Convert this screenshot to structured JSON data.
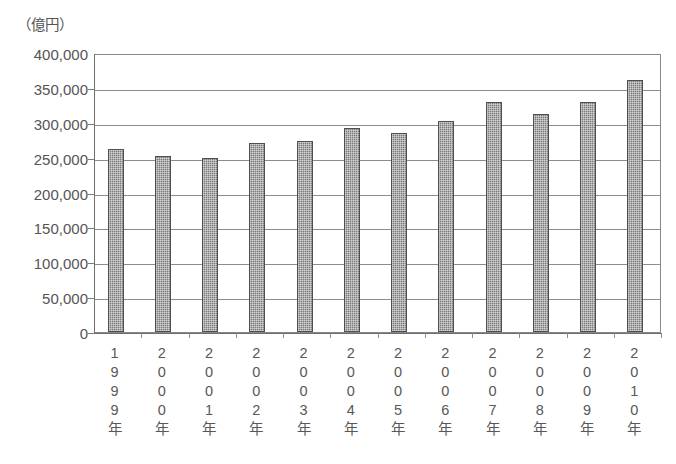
{
  "chart_data": {
    "type": "bar",
    "title": "（億円）",
    "unit_label": "（億円）",
    "xlabel": "",
    "ylabel": "",
    "ylim": [
      0,
      400000
    ],
    "ytick_step": 50000,
    "grid": true,
    "legend": "none",
    "bar_color": "#7b7b7b",
    "bar_border_color": "#4f4f4f",
    "categories": [
      "1999年",
      "2000年",
      "2001年",
      "2002年",
      "2003年",
      "2004年",
      "2005年",
      "2006年",
      "2007年",
      "2008年",
      "2009年",
      "2010年"
    ],
    "values": [
      263000,
      252000,
      250000,
      271000,
      274000,
      293000,
      285000,
      302000,
      330000,
      313000,
      330000,
      361000
    ],
    "ytick_labels": [
      "400,000",
      "350,000",
      "300,000",
      "250,000",
      "200,000",
      "150,000",
      "100,000",
      "50,000",
      "0"
    ],
    "ytick_values": [
      400000,
      350000,
      300000,
      250000,
      200000,
      150000,
      100000,
      50000,
      0
    ]
  }
}
